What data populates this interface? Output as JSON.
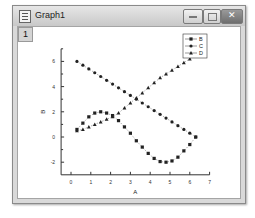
{
  "window": {
    "title": "Graph1",
    "layer_label": "1",
    "buttons": {
      "minimize": "minimize",
      "maximize": "maximize",
      "close": "close"
    }
  },
  "chart_data": {
    "type": "scatter",
    "title": "",
    "xlabel": "A",
    "ylabel": "B",
    "xlim": [
      -0.5,
      7
    ],
    "ylim": [
      -3,
      7
    ],
    "xticks": [
      0,
      1,
      2,
      3,
      4,
      5,
      6,
      7
    ],
    "yticks": [
      -2,
      0,
      2,
      4,
      6
    ],
    "grid": false,
    "legend_position": "top-right",
    "x": [
      0.3,
      0.6,
      0.9,
      1.2,
      1.5,
      1.8,
      2.1,
      2.4,
      2.7,
      3.0,
      3.3,
      3.6,
      3.9,
      4.2,
      4.5,
      4.8,
      5.1,
      5.4,
      5.7,
      6.0,
      6.3
    ],
    "series": [
      {
        "name": "B",
        "marker": "square",
        "values": [
          0.6,
          1.1,
          1.6,
          1.9,
          2.0,
          1.9,
          1.7,
          1.3,
          0.8,
          0.3,
          -0.3,
          -0.8,
          -1.3,
          -1.7,
          -1.95,
          -2.0,
          -1.9,
          -1.6,
          -1.1,
          -0.6,
          0.0
        ]
      },
      {
        "name": "C",
        "marker": "circle",
        "values": [
          6.0,
          5.7,
          5.4,
          5.1,
          4.8,
          4.5,
          4.2,
          3.9,
          3.6,
          3.3,
          3.0,
          2.7,
          2.4,
          2.1,
          1.8,
          1.5,
          1.2,
          0.9,
          0.6,
          0.3,
          0.0
        ]
      },
      {
        "name": "D",
        "marker": "triangle",
        "values": [
          0.5,
          0.6,
          0.8,
          1.0,
          1.2,
          1.4,
          1.6,
          1.9,
          2.3,
          2.7,
          3.1,
          3.5,
          3.9,
          4.3,
          4.7,
          5.0,
          5.3,
          5.6,
          5.9,
          6.2,
          6.5
        ]
      }
    ]
  }
}
